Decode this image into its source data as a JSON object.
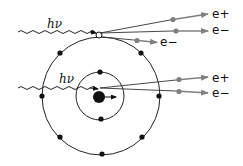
{
  "diagram": {
    "colors": {
      "line": "#222222",
      "electron": "#111111",
      "particle_track": "#808080",
      "background": "#ffffff"
    },
    "photons": [
      {
        "id": "photon-top",
        "label": "hν"
      },
      {
        "id": "photon-bottom",
        "label": "hν"
      }
    ],
    "particles": [
      {
        "id": "top-positron",
        "label": "e+"
      },
      {
        "id": "top-electron",
        "label": "e−"
      },
      {
        "id": "ejected-electron",
        "label": "e−"
      },
      {
        "id": "bottom-positron",
        "label": "e+"
      },
      {
        "id": "bottom-electron",
        "label": "e−"
      }
    ],
    "atom": {
      "outer_shell_electrons": 8,
      "inner_shell_electrons": 2,
      "nucleus": "nucleus"
    }
  }
}
